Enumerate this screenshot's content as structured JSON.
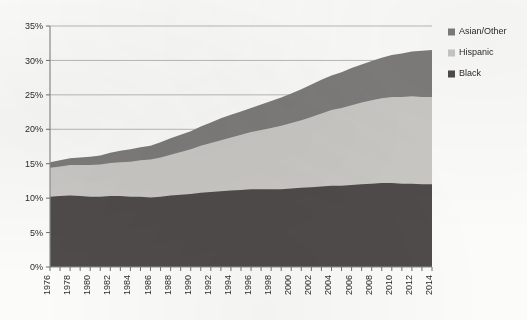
{
  "chart_data": {
    "type": "area",
    "stacked": true,
    "title": "",
    "subtitle": "",
    "xlabel": "",
    "ylabel": "",
    "xlim": [
      1976,
      2014
    ],
    "ylim": [
      0,
      35
    ],
    "ytick_labels": [
      "0%",
      "5%",
      "10%",
      "15%",
      "20%",
      "25%",
      "30%",
      "35%"
    ],
    "ytick_values": [
      0,
      5,
      10,
      15,
      20,
      25,
      30,
      35
    ],
    "grid": "horizontal",
    "legend_position": "right-top",
    "legend_order_top_to_bottom": [
      "Asian/Other",
      "Hispanic",
      "Black"
    ],
    "x": [
      1976,
      1977,
      1978,
      1979,
      1980,
      1981,
      1982,
      1983,
      1984,
      1985,
      1986,
      1987,
      1988,
      1989,
      1990,
      1991,
      1992,
      1993,
      1994,
      1995,
      1996,
      1997,
      1998,
      1999,
      2000,
      2001,
      2002,
      2003,
      2004,
      2005,
      2006,
      2007,
      2008,
      2009,
      2010,
      2011,
      2012,
      2013,
      2014
    ],
    "xtick_labels": [
      "1976",
      "1978",
      "1980",
      "1982",
      "1984",
      "1986",
      "1988",
      "1990",
      "1992",
      "1994",
      "1996",
      "1998",
      "2000",
      "2002",
      "2004",
      "2006",
      "2008",
      "2010",
      "2012",
      "2014"
    ],
    "xtick_label_rotation": -90,
    "series": [
      {
        "name": "Black",
        "color": "#4e4b4a",
        "values": [
          10.2,
          10.3,
          10.4,
          10.3,
          10.2,
          10.2,
          10.3,
          10.3,
          10.2,
          10.2,
          10.1,
          10.2,
          10.4,
          10.5,
          10.6,
          10.8,
          10.9,
          11.0,
          11.1,
          11.2,
          11.3,
          11.3,
          11.3,
          11.3,
          11.4,
          11.5,
          11.6,
          11.7,
          11.8,
          11.8,
          11.9,
          12.0,
          12.1,
          12.2,
          12.2,
          12.1,
          12.1,
          12.0,
          12.0
        ]
      },
      {
        "name": "Hispanic",
        "color": "#c9c8c4",
        "values": [
          4.2,
          4.3,
          4.4,
          4.5,
          4.6,
          4.7,
          4.8,
          4.9,
          5.1,
          5.3,
          5.5,
          5.7,
          5.9,
          6.2,
          6.5,
          6.8,
          7.1,
          7.4,
          7.7,
          8.0,
          8.3,
          8.6,
          8.9,
          9.2,
          9.5,
          9.8,
          10.2,
          10.6,
          11.0,
          11.3,
          11.6,
          11.9,
          12.1,
          12.3,
          12.5,
          12.6,
          12.7,
          12.7,
          12.7
        ]
      },
      {
        "name": "Asian/Other",
        "color": "#7e7c7a",
        "values": [
          0.8,
          0.9,
          1.0,
          1.1,
          1.2,
          1.3,
          1.5,
          1.7,
          1.8,
          1.9,
          2.0,
          2.2,
          2.4,
          2.5,
          2.6,
          2.8,
          3.0,
          3.2,
          3.3,
          3.4,
          3.5,
          3.7,
          3.9,
          4.1,
          4.3,
          4.5,
          4.7,
          4.9,
          5.0,
          5.2,
          5.4,
          5.5,
          5.7,
          5.9,
          6.1,
          6.3,
          6.5,
          6.7,
          6.8
        ]
      }
    ],
    "stack_totals_note": "Top of stack rises from about 15.2% in 1976 to about 31.5% in 2014"
  },
  "legend": {
    "items": [
      {
        "label": "Asian/Other",
        "color": "#7e7c7a"
      },
      {
        "label": "Hispanic",
        "color": "#c9c8c4"
      },
      {
        "label": "Black",
        "color": "#4e4b4a"
      }
    ]
  },
  "colors": {
    "background": "#fbfbf9",
    "gridline": "#b9b9b9",
    "axis": "#8d8d8d",
    "text": "#2b2b2b"
  }
}
